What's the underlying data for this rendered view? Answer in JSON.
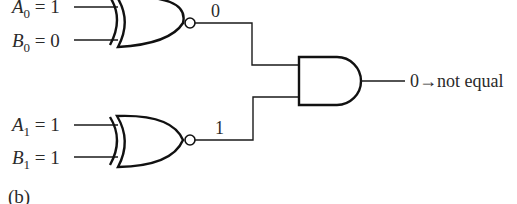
{
  "diagram": {
    "type": "logic-circuit",
    "caption": "(b)",
    "gates": [
      {
        "id": "xnor0",
        "kind": "XNOR",
        "inputs": [
          {
            "name": "A",
            "sub": "0",
            "value": "1"
          },
          {
            "name": "B",
            "sub": "0",
            "value": "0"
          }
        ],
        "output_value": "0"
      },
      {
        "id": "xnor1",
        "kind": "XNOR",
        "inputs": [
          {
            "name": "A",
            "sub": "1",
            "value": "1"
          },
          {
            "name": "B",
            "sub": "1",
            "value": "1"
          }
        ],
        "output_value": "1"
      },
      {
        "id": "and0",
        "kind": "AND",
        "inputs": [
          "xnor0",
          "xnor1"
        ],
        "output_label": "0→not equal"
      }
    ],
    "labels": {
      "a0_var": "A",
      "a0_sub": "0",
      "a0_eq": " = 1",
      "b0_var": "B",
      "b0_sub": "0",
      "b0_eq": " = 0",
      "a1_var": "A",
      "a1_sub": "1",
      "a1_eq": " = 1",
      "b1_var": "B",
      "b1_sub": "1",
      "b1_eq": " = 1",
      "xnor0_out": "0",
      "xnor1_out": "1",
      "and_out": "0→not equal",
      "caption": "(b)"
    },
    "colors": {
      "line": "#111111",
      "text": "#2a2a2a",
      "background": "#ffffff"
    }
  }
}
